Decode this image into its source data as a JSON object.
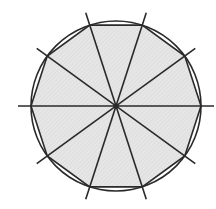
{
  "diagram": {
    "center": [
      116,
      106
    ],
    "circle_radius": 85,
    "polygon_sides": 10,
    "diameter_lines": 5,
    "line_extension": 13,
    "colors": {
      "fill": "#e4e4e4",
      "stroke": "#2a2a2a",
      "background": "#ffffff"
    }
  }
}
